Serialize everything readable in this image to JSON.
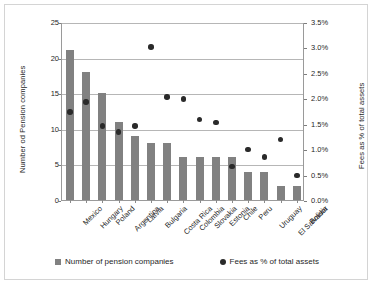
{
  "chart_data": {
    "type": "bar",
    "title": "",
    "xlabel": "",
    "ylabel": "Number od Pension companies",
    "y2label": "Fees as % of total assets",
    "grid": true,
    "legend_position": "bottom",
    "ylim": [
      0,
      25
    ],
    "y2lim": [
      0,
      3.5
    ],
    "yticks": [
      "0",
      "5",
      "10",
      "15",
      "20",
      "25"
    ],
    "y2ticks": [
      "0.0%",
      "0.5%",
      "1.0%",
      "1.5%",
      "2.0%",
      "2.5%",
      "3.0%",
      "3.5%"
    ],
    "categories": [
      "Mexico",
      "Hungary",
      "Poland",
      "Argentina",
      "Latvia",
      "Bulgaria",
      "Costa Rica",
      "Colombia",
      "Slovakia",
      "Estonia",
      "Chile",
      "Peru",
      "Uruguay",
      "El Salvador",
      "Bolivia"
    ],
    "series": [
      {
        "name": "Number of pension companies",
        "type": "bar",
        "axis": "left",
        "color": "#818181",
        "values": [
          21,
          18,
          15,
          11,
          9,
          8,
          8,
          6,
          6,
          6,
          6,
          4,
          4,
          2,
          2
        ]
      },
      {
        "name": "Fees as % of total assets",
        "type": "scatter",
        "axis": "right",
        "color": "#2a2a2a",
        "values": [
          1.75,
          1.95,
          1.48,
          1.36,
          1.48,
          3.03,
          2.05,
          2.0,
          1.6,
          1.54,
          0.68,
          1.01,
          0.87,
          1.21,
          0.5
        ]
      }
    ]
  },
  "legend": {
    "items": [
      {
        "label": "Number of pension companies",
        "marker": "square-marker"
      },
      {
        "label": "Fees as % of total assets",
        "marker": "circle-marker"
      }
    ]
  }
}
